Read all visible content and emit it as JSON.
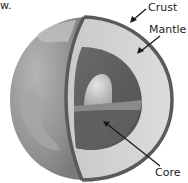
{
  "fragment_text": "w.",
  "diagram": {
    "labels": {
      "crust": "Crust",
      "mantle": "Mantle",
      "core": "Core"
    },
    "colors": {
      "crust_outline": "#5a5a5a",
      "mantle": "#d6d6d6",
      "outer_core": "#6e6e6e",
      "inner_core": "#c4c4c4",
      "globe_surface": "#9a9a9a",
      "land": "#b8b8b8",
      "arrow": "#1a1a1a"
    }
  }
}
